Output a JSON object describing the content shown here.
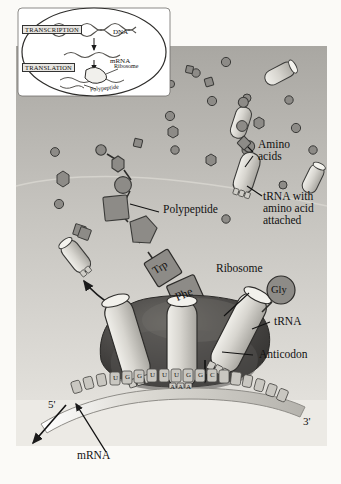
{
  "figure": {
    "background_color": "#fbfaf7",
    "cytoplasm_color": "#b9b7b2",
    "page_color": "#ffffff"
  },
  "inset": {
    "transcription_label": "TRANSCRIPTION",
    "translation_label": "TRANSLATION",
    "dna_label": "DNA",
    "mrna_label": "mRNA",
    "ribosome_label": "Ribosome",
    "polypeptide_label": "Polypeptide"
  },
  "labels": {
    "amino_acids": "Amino\nacids",
    "trna_with_amino_acid": "tRNA with\namino acid\nattached",
    "polypeptide": "Polypeptide",
    "ribosome": "Ribosome",
    "trna": "tRNA",
    "anticodon": "Anticodon",
    "mrna": "mRNA",
    "five_prime": "5'",
    "three_prime": "3'"
  },
  "amino_acid_tags": {
    "trp": "Trp",
    "phe": "Phe",
    "gly": "Gly"
  },
  "mrna_bases": [
    "U",
    "G",
    "G",
    "U",
    "U",
    "U",
    "G",
    "G",
    "C"
  ],
  "anticodon_bases": [
    "A",
    "A",
    "A"
  ],
  "colors": {
    "shape_fill": "#8d8b87",
    "shape_stroke": "#3a3a38",
    "trna_fill": "#d9d8d2",
    "ribosome_dark": "#3b3a38",
    "ribosome_mid": "#6b6966",
    "mrna_strand": "#cfcdc7",
    "line": "#222222"
  }
}
